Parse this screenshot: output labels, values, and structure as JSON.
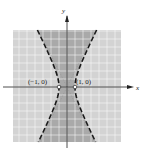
{
  "chart_data": {
    "type": "line",
    "title": "",
    "xlabel": "x",
    "ylabel": "y",
    "xlim": [
      -7,
      7
    ],
    "ylim": [
      -7,
      7
    ],
    "grid": true,
    "grid_step": 1,
    "curve": {
      "equation": "x^2 - y^2/4 = 1",
      "style": "dashed",
      "color": "#1a1a1a"
    },
    "shaded_region": {
      "description": "x^2 - y^2/4 < 1",
      "color": "#a9a9a9"
    },
    "background_region_color": "#d3d3d3",
    "points": [
      {
        "label": "(−1, 0)",
        "x": -1,
        "y": 0,
        "style": "open-circle"
      },
      {
        "label": "(1, 0)",
        "x": 1,
        "y": 0,
        "style": "open-circle"
      }
    ]
  },
  "labels": {
    "x_axis": "x",
    "y_axis": "y",
    "left_vertex": "(−1, 0)",
    "right_vertex": "(1, 0)"
  }
}
